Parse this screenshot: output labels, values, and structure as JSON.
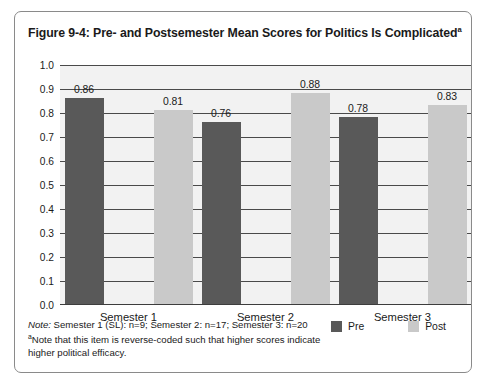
{
  "figure": {
    "title": "Figure 9-4:  Pre- and Postsemester Mean Scores for Politics Is Complicated",
    "title_superscript": "a"
  },
  "notes": {
    "note_lead": "Note:",
    "note_text": " Semester 1 (SL): n=9; Semester 2: n=17; Semester 3: n=20",
    "footnote_marker": "a",
    "footnote_text": "Note that this item is reverse-coded such that higher scores indicate higher political efficacy."
  },
  "legend": {
    "items": [
      {
        "label": "Pre",
        "color": "#595959"
      },
      {
        "label": "Post",
        "color": "#c9c9c9"
      }
    ]
  },
  "chart_data": {
    "type": "bar",
    "title": "Figure 9-4:  Pre- and Postsemester Mean Scores for Politics Is Complicated",
    "xlabel": "",
    "ylabel": "",
    "categories": [
      "Semester 1",
      "Semester 2",
      "Semester 3"
    ],
    "series": [
      {
        "name": "Pre",
        "color": "#595959",
        "values": [
          0.86,
          0.76,
          0.78
        ]
      },
      {
        "name": "Post",
        "color": "#c9c9c9",
        "values": [
          0.81,
          0.88,
          0.83
        ]
      }
    ],
    "value_labels": [
      "0.86",
      "0.81",
      "0.76",
      "0.88",
      "0.78",
      "0.83"
    ],
    "ylim": [
      0.0,
      1.0
    ],
    "ytick_step": 0.1,
    "ytick_labels": [
      "1.0",
      "0.9",
      "0.8",
      "0.7",
      "0.6",
      "0.5",
      "0.4",
      "0.3",
      "0.2",
      "0.1",
      "0.0"
    ],
    "grid": true,
    "legend_position": "bottom-right",
    "sample_sizes": {
      "Semester 1": 9,
      "Semester 2": 17,
      "Semester 3": 20
    }
  }
}
